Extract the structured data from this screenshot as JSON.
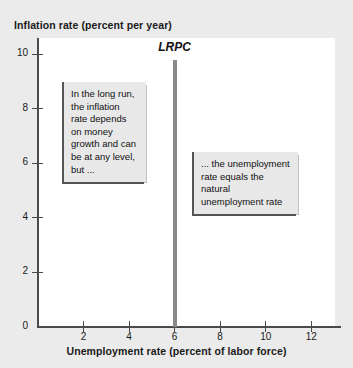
{
  "chart_data": {
    "type": "line",
    "title": "",
    "xlabel": "Unemployment rate (percent of labor force)",
    "ylabel": "Inflation rate (percent per year)",
    "xlim": [
      0,
      13
    ],
    "ylim": [
      0,
      10.6
    ],
    "grid": false,
    "legend": null,
    "xticks": [
      {
        "value": 2,
        "label": "2"
      },
      {
        "value": 4,
        "label": "4"
      },
      {
        "value": 6,
        "label": "6"
      },
      {
        "value": 8,
        "label": "8"
      },
      {
        "value": 10,
        "label": "10"
      },
      {
        "value": 12,
        "label": "12"
      }
    ],
    "yticks": [
      {
        "value": 0,
        "label": "0"
      },
      {
        "value": 2,
        "label": "2"
      },
      {
        "value": 4,
        "label": "4"
      },
      {
        "value": 6,
        "label": "6"
      },
      {
        "value": 8,
        "label": "8"
      },
      {
        "value": 10,
        "label": "10"
      }
    ],
    "series": [
      {
        "name": "LRPC",
        "label": "LRPC",
        "type": "vertical-line",
        "color": "#8a8a8a",
        "x": 6,
        "y_start": 0,
        "y_end": 9.8,
        "points": [
          {
            "x": 6,
            "y": 0
          },
          {
            "x": 6,
            "y": 9.8
          }
        ]
      }
    ],
    "annotations": [
      {
        "id": "long-run",
        "text": "In the long run, the inflation rate depends on money growth and can be at any level, but ...",
        "x": 1.2,
        "y": 8.5
      },
      {
        "id": "natural-rate",
        "text": "... the unemployment rate equals the natural unemployment rate",
        "x": 6.8,
        "y": 6.1
      }
    ]
  },
  "figure": {
    "axis_title_y": "Inflation rate (percent per year)",
    "axis_title_x": "Unemployment rate (percent of labor force)",
    "curve_label": "LRPC",
    "callouts": {
      "long_run": "In the long run, the inflation rate depends on money growth and can be at any level, but ...",
      "natural_rate": "... the unemployment rate equals the natural unemployment rate"
    },
    "colors": {
      "page_background": "#ebebeb",
      "plot_background": "#ffffff",
      "axis": "#4a4a4a",
      "curve": "#8a8a8a",
      "callout_fill": "#e8e8e8",
      "callout_rule": "#555555",
      "text": "#1a1a1a"
    }
  }
}
